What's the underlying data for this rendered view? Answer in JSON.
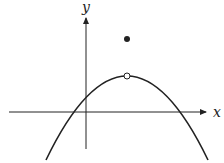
{
  "diagram": {
    "type": "function-graph",
    "axes": {
      "x_label": "x",
      "y_label": "y"
    },
    "curve": {
      "shape": "parabola-opening-down",
      "vertex_px": [
        127,
        76
      ],
      "x_intercepts_px": [
        68,
        180
      ],
      "y_intercept_px": [
        86,
        93
      ]
    },
    "points": [
      {
        "kind": "open",
        "px": [
          127,
          76
        ]
      },
      {
        "kind": "filled",
        "px": [
          127,
          39
        ]
      }
    ],
    "colors": {
      "stroke": "#222222",
      "background": "#ffffff"
    }
  }
}
